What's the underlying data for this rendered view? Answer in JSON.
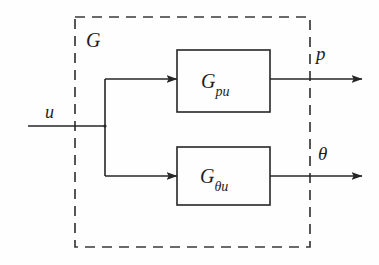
{
  "figure": {
    "type": "block-diagram",
    "background_color": "#fefefe",
    "stroke_color": "#262626",
    "boundary": {
      "label": "G",
      "style": "dashed",
      "x": 75,
      "y": 17,
      "width": 235,
      "height": 230
    },
    "input": {
      "label": "u",
      "line_y": 126,
      "start_x": 28,
      "branch_x": 105
    },
    "blocks": [
      {
        "name": "block-gpu",
        "label_main": "G",
        "label_sub": "pu",
        "x": 177,
        "y": 50,
        "width": 93,
        "height": 62,
        "signal_y": 79
      },
      {
        "name": "block-gthetau",
        "label_main": "G",
        "label_sub": "θu",
        "x": 177,
        "y": 147,
        "width": 93,
        "height": 58,
        "signal_y": 176
      }
    ],
    "outputs": [
      {
        "label": "p",
        "line_y": 79,
        "end_x": 362
      },
      {
        "label": "θ",
        "line_y": 176,
        "end_x": 362
      }
    ]
  }
}
